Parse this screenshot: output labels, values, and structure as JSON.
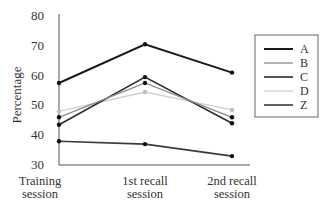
{
  "chart_data": {
    "type": "line",
    "title": "",
    "xlabel": "",
    "ylabel": "Percentage",
    "ylim": [
      30,
      80
    ],
    "yticks": [
      30,
      40,
      50,
      60,
      70,
      80
    ],
    "grid": false,
    "legend_position": "right",
    "categories": [
      "Training session",
      "1st recall session",
      "2nd recall session"
    ],
    "category_lines": [
      [
        "Training",
        "session"
      ],
      [
        "1st recall",
        "session"
      ],
      [
        "2nd recall",
        "session"
      ]
    ],
    "series": [
      {
        "name": "A",
        "values": [
          57.5,
          70.5,
          61
        ],
        "color": "#1a1a1a",
        "width": 2
      },
      {
        "name": "B",
        "values": [
          46,
          57.5,
          46
        ],
        "color": "#8a8a8a",
        "width": 1.3
      },
      {
        "name": "C",
        "values": [
          43.5,
          59.5,
          44
        ],
        "color": "#2b2b2b",
        "width": 1.6
      },
      {
        "name": "D",
        "values": [
          48,
          54.5,
          48.5
        ],
        "color": "#cfcfcf",
        "width": 1.3
      },
      {
        "name": "Z",
        "values": [
          38,
          37,
          33
        ],
        "color": "#3a3a3a",
        "width": 1.6
      }
    ]
  }
}
